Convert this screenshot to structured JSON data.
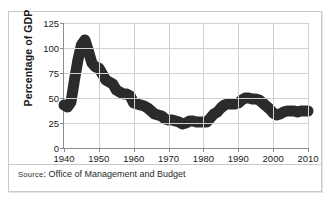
{
  "chart_data": {
    "type": "line",
    "title": "",
    "xlabel": "",
    "ylabel": "Percentage of GDP",
    "xlim": [
      1940,
      2010
    ],
    "ylim": [
      0,
      125
    ],
    "grid": true,
    "legend": "none",
    "x_ticks": [
      "1940",
      "1950",
      "1960",
      "1970",
      "1980",
      "1990",
      "2000",
      "2010"
    ],
    "y_ticks": [
      "0",
      "25",
      "50",
      "75",
      "100",
      "125"
    ],
    "line_color": "#2b2b2b",
    "grid_color": "#d0d0d0",
    "series": [
      {
        "name": "Federal debt as percentage of GDP",
        "x": [
          1940,
          1941,
          1942,
          1943,
          1944,
          1945,
          1946,
          1947,
          1948,
          1949,
          1950,
          1951,
          1952,
          1953,
          1954,
          1955,
          1956,
          1957,
          1958,
          1959,
          1960,
          1961,
          1962,
          1963,
          1964,
          1965,
          1966,
          1967,
          1968,
          1969,
          1970,
          1971,
          1972,
          1973,
          1974,
          1975,
          1976,
          1977,
          1978,
          1979,
          1980,
          1981,
          1982,
          1983,
          1984,
          1985,
          1986,
          1987,
          1988,
          1989,
          1990,
          1991,
          1992,
          1993,
          1994,
          1995,
          1996,
          1997,
          1998,
          1999,
          2000,
          2001,
          2002,
          2003,
          2004,
          2005,
          2006,
          2007,
          2008,
          2009,
          2010
        ],
        "values": [
          43,
          41,
          46,
          68,
          88,
          103,
          108,
          97,
          85,
          81,
          80,
          74,
          68,
          66,
          64,
          58,
          56,
          54,
          54,
          52,
          45,
          44,
          43,
          42,
          40,
          37,
          34,
          33,
          32,
          29,
          28,
          28,
          27,
          26,
          24,
          25,
          27,
          27,
          26,
          26,
          26,
          26,
          30,
          34,
          36,
          40,
          43,
          44,
          44,
          44,
          45,
          48,
          50,
          50,
          49,
          49,
          48,
          45,
          42,
          39,
          35,
          33,
          34,
          36,
          37,
          37,
          37,
          36,
          37,
          37,
          37
        ]
      }
    ]
  },
  "axis": {
    "y_title": "Percentage of GDP"
  },
  "source": {
    "label": "Source",
    "colon": ": ",
    "text": "Office of Management and Budget"
  }
}
